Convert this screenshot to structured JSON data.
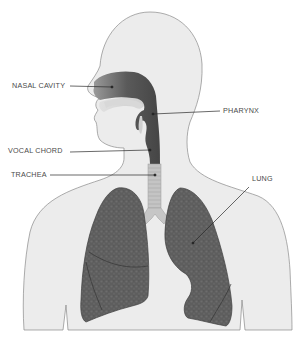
{
  "diagram": {
    "colors": {
      "background": "#ffffff",
      "body_fill": "#ececec",
      "body_outline": "#8a8a8a",
      "airway_dark": "#4a4a4a",
      "lung_fill": "#5e5e5e",
      "trachea_fill": "#c4c4c4",
      "label_text": "#4a4a4a",
      "leader_line": "#2a2a2a"
    },
    "labels": [
      {
        "id": "nasal-cavity",
        "text": "NASAL CAVITY",
        "side": "left"
      },
      {
        "id": "pharynx",
        "text": "PHARYNX",
        "side": "right"
      },
      {
        "id": "vocal-chord",
        "text": "VOCAL CHORD",
        "side": "left"
      },
      {
        "id": "trachea",
        "text": "TRACHEA",
        "side": "left"
      },
      {
        "id": "lung",
        "text": "LUNG",
        "side": "right"
      }
    ]
  }
}
